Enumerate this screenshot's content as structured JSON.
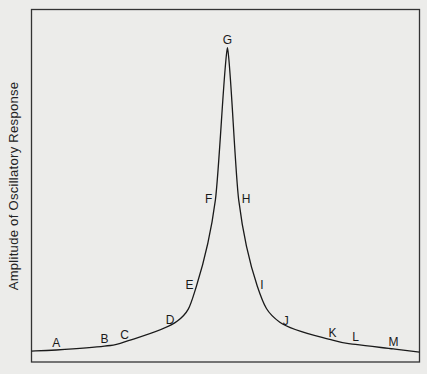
{
  "chart_data": {
    "type": "line",
    "title": "",
    "xlabel": "",
    "ylabel": "Amplitude of Oscillatory Response",
    "xlim": [
      0,
      100
    ],
    "ylim": [
      0,
      100
    ],
    "grid": false,
    "legend": "none",
    "x_ticks": [],
    "y_ticks": [],
    "curve": {
      "name": "resonance-curve",
      "x": [
        0,
        6.4,
        18.8,
        24,
        37.6,
        42.5,
        47.4,
        50.5,
        53.4,
        58.2,
        64,
        77.6,
        83.5,
        93.3,
        100
      ],
      "y": [
        3.1,
        3.4,
        4.5,
        5.7,
        11.6,
        21.5,
        46,
        89,
        46,
        21.5,
        11.3,
        6.2,
        5.0,
        3.7,
        2.8
      ]
    },
    "points": [
      {
        "label": "A",
        "x": 6.4,
        "y": 3.4,
        "side": "above"
      },
      {
        "label": "B",
        "x": 18.8,
        "y": 4.5,
        "side": "above"
      },
      {
        "label": "C",
        "x": 24,
        "y": 5.7,
        "side": "above"
      },
      {
        "label": "D",
        "x": 37.6,
        "y": 11.6,
        "side": "left"
      },
      {
        "label": "E",
        "x": 42.5,
        "y": 21.5,
        "side": "left"
      },
      {
        "label": "F",
        "x": 47.4,
        "y": 46,
        "side": "left"
      },
      {
        "label": "G",
        "x": 50.5,
        "y": 89,
        "side": "above"
      },
      {
        "label": "H",
        "x": 53.4,
        "y": 46,
        "side": "right"
      },
      {
        "label": "I",
        "x": 58.2,
        "y": 21.5,
        "side": "right"
      },
      {
        "label": "J",
        "x": 64,
        "y": 11.3,
        "side": "right"
      },
      {
        "label": "K",
        "x": 77.6,
        "y": 6.2,
        "side": "above"
      },
      {
        "label": "L",
        "x": 83.5,
        "y": 5.0,
        "side": "above"
      },
      {
        "label": "M",
        "x": 93.3,
        "y": 3.7,
        "side": "above"
      }
    ]
  }
}
